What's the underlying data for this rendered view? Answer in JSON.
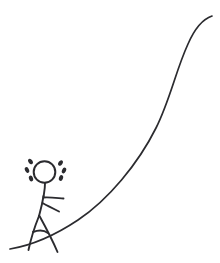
{
  "image": {
    "title": "Stick figure climbing a steep hill",
    "description": "A hand-drawn black-ink sketch of a sweating stick figure walking uphill along a long S-shaped curve",
    "style": "hand-drawn line sketch",
    "width": 220,
    "height": 263,
    "background_color": "#ffffff",
    "ink_color": "#2b2b2f"
  },
  "scene": {
    "elements": [
      {
        "name": "hill-curve",
        "label": "Hill slope",
        "shape": "s-curve"
      },
      {
        "name": "stick-figure",
        "label": "Climbing stick figure",
        "shape": "stick-person"
      },
      {
        "name": "sweat-drops",
        "label": "Sweat drops",
        "count": 6
      }
    ]
  },
  "hill": {
    "name": "hill-curve",
    "label": "Uphill slope line",
    "stroke": "#2b2b2f",
    "stroke_width": 1.7,
    "path": "M 10 249 C 34 245 54 236 78 220 C 108 200 138 164 156 128 C 170 100 176 70 188 44 C 195 28 203 19 212 16"
  },
  "figure": {
    "name": "stick-figure",
    "label": "Climbing stick figure",
    "head": {
      "cx": 44.5,
      "cy": 172,
      "r": 10.8
    },
    "neck": {
      "path": "M 45 183 C 45 189 44 193 43.5 197"
    },
    "torso": {
      "path": "M 43.5 196 C 42 206 40 212 39 216"
    },
    "arm_upper": {
      "path": "M 43.5 197.5 C 50 197 57 198 63.5 198.5"
    },
    "arm_lower": {
      "path": "M 42.5 203 C 48 206 54 209 59 211.5"
    },
    "leg_left": {
      "path": "M 39 216 C 35 226 31 238 28.5 250"
    },
    "leg_right": {
      "path": "M 39.5 216 C 45 226 52 239 57.5 252"
    },
    "hip_brace": {
      "path": "M 33 232 C 38 230 44 230 48 233"
    }
  },
  "sweat": {
    "name": "sweat-drops",
    "label": "Sweat droplets",
    "left": [
      {
        "cx": 30.5,
        "cy": 161.5,
        "rx": 2.0,
        "ry": 3.0,
        "rot": -35
      },
      {
        "cx": 27.0,
        "cy": 170.0,
        "rx": 2.0,
        "ry": 3.0,
        "rot": -25
      },
      {
        "cx": 31.0,
        "cy": 178.5,
        "rx": 2.0,
        "ry": 3.0,
        "rot": -20
      }
    ],
    "right": [
      {
        "cx": 60.5,
        "cy": 163.0,
        "rx": 2.0,
        "ry": 3.0,
        "rot": 35
      },
      {
        "cx": 64.0,
        "cy": 170.5,
        "rx": 2.0,
        "ry": 3.0,
        "rot": 25
      },
      {
        "cx": 61.0,
        "cy": 178.0,
        "rx": 2.0,
        "ry": 3.0,
        "rot": 20
      }
    ]
  }
}
